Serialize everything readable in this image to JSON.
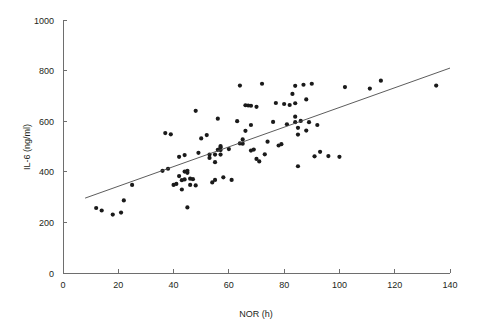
{
  "chart_data": {
    "type": "scatter",
    "title": "",
    "subtitle": "",
    "xlabel": "NOR (h)",
    "ylabel": "IL-6 (ng/ml)",
    "xlim": [
      0,
      140
    ],
    "ylim": [
      0,
      1000
    ],
    "xticks": [
      0,
      20,
      40,
      60,
      80,
      100,
      120,
      140
    ],
    "yticks": [
      0,
      200,
      400,
      600,
      800,
      1000
    ],
    "xtick_labels": [
      "0",
      "20",
      "40",
      "60",
      "80",
      "100",
      "120",
      "140"
    ],
    "ytick_labels": [
      "0",
      "200",
      "400",
      "600",
      "800",
      "1000"
    ],
    "grid": false,
    "legend": null,
    "legend_position": "none",
    "marker": "filled-circle",
    "marker_color": "#1a1a1a",
    "marker_size": 2.1,
    "series": [
      {
        "name": "IL-6 vs NOR",
        "points": [
          [
            12,
            257
          ],
          [
            14,
            247
          ],
          [
            18,
            231
          ],
          [
            21,
            239
          ],
          [
            22,
            287
          ],
          [
            25,
            348
          ],
          [
            36,
            404
          ],
          [
            37,
            553
          ],
          [
            38,
            412
          ],
          [
            39,
            548
          ],
          [
            40,
            348
          ],
          [
            41,
            352
          ],
          [
            42,
            383
          ],
          [
            42,
            459
          ],
          [
            43,
            330
          ],
          [
            43,
            367
          ],
          [
            44,
            401
          ],
          [
            44,
            466
          ],
          [
            44,
            370
          ],
          [
            45,
            396
          ],
          [
            45,
            404
          ],
          [
            45,
            259
          ],
          [
            46,
            348
          ],
          [
            46,
            373
          ],
          [
            47,
            371
          ],
          [
            48,
            346
          ],
          [
            48,
            641
          ],
          [
            49,
            475
          ],
          [
            50,
            532
          ],
          [
            52,
            545
          ],
          [
            53,
            468
          ],
          [
            53,
            455
          ],
          [
            54,
            358
          ],
          [
            55,
            368
          ],
          [
            55,
            438
          ],
          [
            55,
            468
          ],
          [
            56,
            610
          ],
          [
            56,
            487
          ],
          [
            57,
            468
          ],
          [
            57,
            486
          ],
          [
            57,
            497
          ],
          [
            57,
            502
          ],
          [
            58,
            378
          ],
          [
            60,
            490
          ],
          [
            61,
            368
          ],
          [
            63,
            600
          ],
          [
            64,
            741
          ],
          [
            64,
            512
          ],
          [
            65,
            511
          ],
          [
            65,
            528
          ],
          [
            66,
            562
          ],
          [
            66,
            663
          ],
          [
            67,
            662
          ],
          [
            68,
            661
          ],
          [
            68,
            484
          ],
          [
            68,
            585
          ],
          [
            69,
            488
          ],
          [
            70,
            657
          ],
          [
            70,
            451
          ],
          [
            71,
            441
          ],
          [
            72,
            748
          ],
          [
            73,
            469
          ],
          [
            74,
            519
          ],
          [
            76,
            597
          ],
          [
            77,
            672
          ],
          [
            78,
            504
          ],
          [
            79,
            509
          ],
          [
            80,
            668
          ],
          [
            81,
            588
          ],
          [
            82,
            664
          ],
          [
            83,
            708
          ],
          [
            84,
            740
          ],
          [
            84,
            671
          ],
          [
            84,
            618
          ],
          [
            84,
            596
          ],
          [
            85,
            574
          ],
          [
            85,
            547
          ],
          [
            85,
            422
          ],
          [
            86,
            601
          ],
          [
            87,
            744
          ],
          [
            88,
            686
          ],
          [
            88,
            563
          ],
          [
            89,
            596
          ],
          [
            90,
            748
          ],
          [
            91,
            461
          ],
          [
            92,
            585
          ],
          [
            93,
            479
          ],
          [
            96,
            462
          ],
          [
            100,
            459
          ],
          [
            102,
            735
          ],
          [
            111,
            729
          ],
          [
            115,
            760
          ],
          [
            135,
            741
          ]
        ]
      }
    ],
    "trendline": {
      "type": "linear",
      "x_start": 8,
      "y_start": 296,
      "x_end": 140,
      "y_end": 810
    }
  }
}
